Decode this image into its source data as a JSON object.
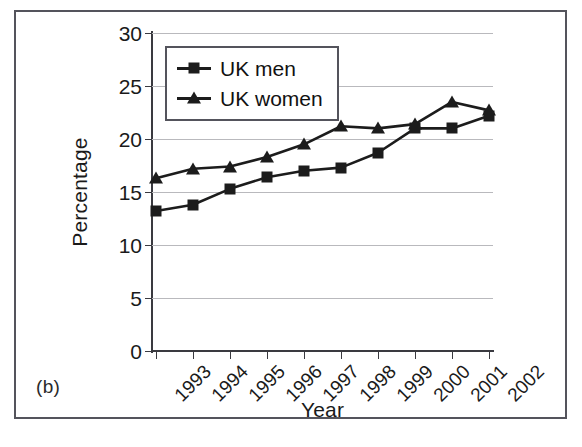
{
  "figure": {
    "panel_letter": "(b)"
  },
  "chart_data": {
    "type": "line",
    "title": "",
    "xlabel": "Year",
    "ylabel": "Percentage",
    "categories": [
      "1993",
      "1994",
      "1995",
      "1996",
      "1997",
      "1998",
      "1999",
      "2000",
      "2001",
      "2002"
    ],
    "ylim": [
      0,
      30
    ],
    "yticks": [
      0,
      5,
      10,
      15,
      20,
      25,
      30
    ],
    "ytick_labels": [
      "0",
      "5",
      "10",
      "15",
      "20",
      "25",
      "30"
    ],
    "grid": "horizontal",
    "legend_position": "top-left-inside",
    "series": [
      {
        "name": "UK men",
        "marker": "square",
        "color": "#1c1c1c",
        "values": [
          13.2,
          13.8,
          15.3,
          16.4,
          17.0,
          17.3,
          18.7,
          21.0,
          21.0,
          22.2
        ]
      },
      {
        "name": "UK women",
        "marker": "triangle",
        "color": "#1c1c1c",
        "values": [
          16.3,
          17.2,
          17.4,
          18.3,
          19.5,
          21.2,
          21.0,
          21.4,
          23.5,
          22.7
        ]
      }
    ]
  }
}
